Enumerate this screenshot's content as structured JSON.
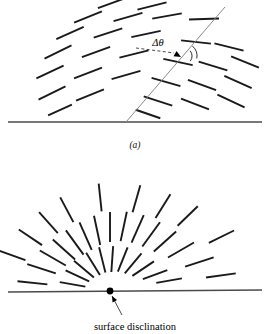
{
  "figure": {
    "title_visible": false,
    "background_color": "#ffffff",
    "ink_color": "#1a1a1a",
    "baseline_color": "#4a4a4a",
    "disclination_line_color": "#8a8a8a",
    "panels": [
      {
        "id": "panel-a",
        "label": "(a)",
        "label_position": {
          "x": 135,
          "y": 148
        },
        "description": "splay-bend director field with a tilt disclination line rising from the surface",
        "baseline": {
          "x1": 8,
          "y1": 122,
          "x2": 262,
          "y2": 122
        },
        "disclination_line": {
          "x1": 126,
          "y1": 122,
          "x2": 225,
          "y2": 7
        },
        "angle_label": "Δθ",
        "angle_label_position": {
          "x": 158,
          "y": 46
        },
        "arrow_tip": {
          "x": 181,
          "y": 57
        },
        "arc_radius": 13
      },
      {
        "id": "panel-b",
        "label": "",
        "description": "radial surface disclination of strength one-half at the free surface",
        "baseline": {
          "x1": 8,
          "y1": 292,
          "x2": 262,
          "y2": 290
        },
        "disclination_point": {
          "x": 110,
          "y": 291,
          "r": 3.4
        },
        "caption": "surface disclination",
        "caption_position": {
          "x": 135,
          "y": 330
        },
        "arrow_from": {
          "x": 122,
          "y": 315
        },
        "arrow_to": {
          "x": 112,
          "y": 296
        }
      }
    ]
  },
  "chart_data": {
    "type": "diagram",
    "title": "",
    "xlabel": "",
    "ylabel": "",
    "panel_a_segments": [
      {
        "x": 112,
        "y": 3,
        "angle": 20,
        "len": 30
      },
      {
        "x": 152,
        "y": 6,
        "angle": 14,
        "len": 30
      },
      {
        "x": 88,
        "y": 17,
        "angle": 22,
        "len": 30
      },
      {
        "x": 128,
        "y": 17,
        "angle": 16,
        "len": 30
      },
      {
        "x": 167,
        "y": 16,
        "angle": 10,
        "len": 30
      },
      {
        "x": 204,
        "y": 19,
        "angle": 2,
        "len": 30
      },
      {
        "x": 70,
        "y": 33,
        "angle": 24,
        "len": 30
      },
      {
        "x": 108,
        "y": 33,
        "angle": 18,
        "len": 30
      },
      {
        "x": 146,
        "y": 34,
        "angle": 12,
        "len": 30
      },
      {
        "x": 196,
        "y": 42,
        "angle": -6,
        "len": 30
      },
      {
        "x": 229,
        "y": 47,
        "angle": -14,
        "len": 30
      },
      {
        "x": 58,
        "y": 52,
        "angle": 26,
        "len": 30
      },
      {
        "x": 96,
        "y": 52,
        "angle": 20,
        "len": 30
      },
      {
        "x": 134,
        "y": 54,
        "angle": 14,
        "len": 30
      },
      {
        "x": 178,
        "y": 62,
        "angle": -12,
        "len": 30
      },
      {
        "x": 213,
        "y": 66,
        "angle": -17,
        "len": 30
      },
      {
        "x": 245,
        "y": 62,
        "angle": -22,
        "len": 30
      },
      {
        "x": 50,
        "y": 72,
        "angle": 25,
        "len": 30
      },
      {
        "x": 88,
        "y": 73,
        "angle": 21,
        "len": 30
      },
      {
        "x": 126,
        "y": 75,
        "angle": 16,
        "len": 30
      },
      {
        "x": 166,
        "y": 82,
        "angle": -16,
        "len": 30
      },
      {
        "x": 202,
        "y": 85,
        "angle": -20,
        "len": 30
      },
      {
        "x": 238,
        "y": 82,
        "angle": -24,
        "len": 30
      },
      {
        "x": 52,
        "y": 93,
        "angle": 26,
        "len": 30
      },
      {
        "x": 90,
        "y": 95,
        "angle": 22,
        "len": 30
      },
      {
        "x": 158,
        "y": 101,
        "angle": -18,
        "len": 30
      },
      {
        "x": 195,
        "y": 104,
        "angle": -21,
        "len": 30
      },
      {
        "x": 231,
        "y": 101,
        "angle": -25,
        "len": 30
      },
      {
        "x": 60,
        "y": 110,
        "angle": 24,
        "len": 26
      },
      {
        "x": 148,
        "y": 114,
        "angle": -19,
        "len": 26
      }
    ],
    "panel_b_segments": [
      {
        "cx": 110,
        "cy": 291,
        "theta": 174,
        "r": 78,
        "len": 30
      },
      {
        "cx": 110,
        "cy": 291,
        "theta": 162,
        "r": 72,
        "len": 30
      },
      {
        "cx": 110,
        "cy": 291,
        "theta": 150,
        "r": 66,
        "len": 30
      },
      {
        "cx": 110,
        "cy": 291,
        "theta": 138,
        "r": 62,
        "len": 30
      },
      {
        "cx": 110,
        "cy": 291,
        "theta": 126,
        "r": 60,
        "len": 30
      },
      {
        "cx": 110,
        "cy": 291,
        "theta": 114,
        "r": 60,
        "len": 30
      },
      {
        "cx": 110,
        "cy": 291,
        "theta": 102,
        "r": 62,
        "len": 30
      },
      {
        "cx": 110,
        "cy": 291,
        "theta": 90,
        "r": 64,
        "len": 30
      },
      {
        "cx": 110,
        "cy": 291,
        "theta": 78,
        "r": 66,
        "len": 30
      },
      {
        "cx": 110,
        "cy": 291,
        "theta": 66,
        "r": 68,
        "len": 30
      },
      {
        "cx": 110,
        "cy": 291,
        "theta": 54,
        "r": 70,
        "len": 30
      },
      {
        "cx": 110,
        "cy": 291,
        "theta": 42,
        "r": 74,
        "len": 30
      },
      {
        "cx": 110,
        "cy": 291,
        "theta": 30,
        "r": 82,
        "len": 30
      },
      {
        "cx": 110,
        "cy": 291,
        "theta": 18,
        "r": 94,
        "len": 30
      },
      {
        "cx": 110,
        "cy": 291,
        "theta": 8,
        "r": 112,
        "len": 30
      },
      {
        "cx": 110,
        "cy": 291,
        "theta": 170,
        "r": 38,
        "len": 26
      },
      {
        "cx": 110,
        "cy": 291,
        "theta": 155,
        "r": 36,
        "len": 26
      },
      {
        "cx": 110,
        "cy": 291,
        "theta": 140,
        "r": 34,
        "len": 26
      },
      {
        "cx": 110,
        "cy": 291,
        "theta": 122,
        "r": 32,
        "len": 26
      },
      {
        "cx": 110,
        "cy": 291,
        "theta": 104,
        "r": 32,
        "len": 26
      },
      {
        "cx": 110,
        "cy": 291,
        "theta": 86,
        "r": 32,
        "len": 26
      },
      {
        "cx": 110,
        "cy": 291,
        "theta": 68,
        "r": 34,
        "len": 26
      },
      {
        "cx": 110,
        "cy": 291,
        "theta": 50,
        "r": 36,
        "len": 26
      },
      {
        "cx": 110,
        "cy": 291,
        "theta": 34,
        "r": 40,
        "len": 26
      },
      {
        "cx": 110,
        "cy": 291,
        "theta": 20,
        "r": 48,
        "len": 26
      },
      {
        "cx": 110,
        "cy": 291,
        "theta": 10,
        "r": 60,
        "len": 26
      },
      {
        "cx": 110,
        "cy": 291,
        "theta": 160,
        "r": 104,
        "len": 28
      },
      {
        "cx": 110,
        "cy": 291,
        "theta": 146,
        "r": 96,
        "len": 28
      },
      {
        "cx": 110,
        "cy": 291,
        "theta": 132,
        "r": 92,
        "len": 28
      },
      {
        "cx": 110,
        "cy": 291,
        "theta": 118,
        "r": 92,
        "len": 28
      },
      {
        "cx": 110,
        "cy": 291,
        "theta": 96,
        "r": 94,
        "len": 28
      },
      {
        "cx": 110,
        "cy": 291,
        "theta": 74,
        "r": 96,
        "len": 28
      },
      {
        "cx": 110,
        "cy": 291,
        "theta": 58,
        "r": 100,
        "len": 28
      },
      {
        "cx": 110,
        "cy": 291,
        "theta": 44,
        "r": 108,
        "len": 28
      },
      {
        "cx": 110,
        "cy": 291,
        "theta": 26,
        "r": 124,
        "len": 28
      }
    ]
  }
}
